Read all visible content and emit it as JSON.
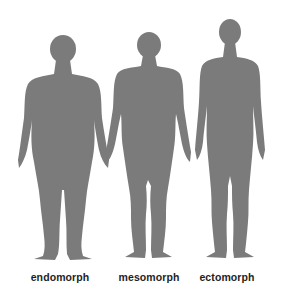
{
  "colors": {
    "background": "#ffffff",
    "silhouette": "#7b7b7b",
    "label_text": "#1e1e1e"
  },
  "figures": [
    {
      "id": "endomorph",
      "label": "endomorph",
      "center_x": 60
    },
    {
      "id": "mesomorph",
      "label": "mesomorph",
      "center_x": 149
    },
    {
      "id": "ectomorph",
      "label": "ectomorph",
      "center_x": 227
    }
  ]
}
